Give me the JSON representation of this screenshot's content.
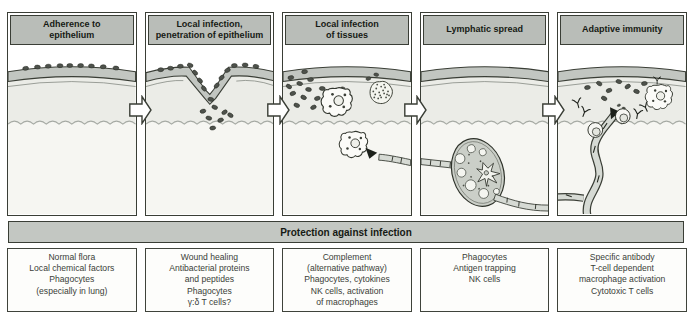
{
  "panels": [
    {
      "title": "Adherence to\nepithelium",
      "art": "bacteria-adhering-to-epithelium-illustration",
      "protection": "Normal flora\nLocal chemical factors\nPhagocytes\n(especially in lung)"
    },
    {
      "title": "Local infection,\npenetration of epithelium",
      "art": "bacteria-penetrating-epithelium-wound-illustration",
      "protection": "Wound healing\nAntibacterial proteins\nand peptides\nPhagocytes\nγ:δ T cells?"
    },
    {
      "title": "Local infection\nof tissues",
      "art": "tissue-infection-phagocytes-illustration",
      "protection": "Complement\n(alternative pathway)\nPhagocytes, cytokines\nNK cells, activation\nof macrophages"
    },
    {
      "title": "Lymphatic spread",
      "art": "lymph-node-lymphatic-vessels-illustration",
      "protection": "Phagocytes\nAntigen trapping\nNK cells"
    },
    {
      "title": "Adaptive immunity",
      "art": "antibodies-lymphocytes-macrophage-illustration",
      "protection": "Specific antibody\nT-cell dependent\nmacrophage activation\nCytotoxic T cells"
    }
  ],
  "banner": {
    "label": "Protection against infection"
  },
  "icons": {
    "flow_arrow": "right-block-arrow-icon"
  },
  "colors": {
    "header_fill": "#b9bdb8",
    "banner_fill": "#c3c7c2",
    "epithelium_fill": "#c2c6c1",
    "tissue_fill": "#ebece7",
    "submucosa_fill": "#f6f6f2",
    "bacteria_fill": "#4e524c",
    "vessel_fill": "#d6dad4",
    "lymph_node_fill": "#cbcfc8",
    "outline": "#3a3e36"
  }
}
